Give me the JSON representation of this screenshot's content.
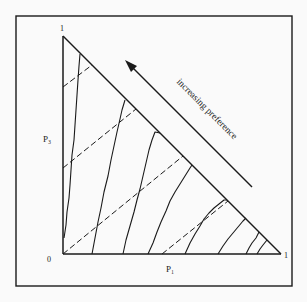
{
  "figure": {
    "type": "probability-triangle",
    "axes": {
      "x_label": "P₁",
      "y_label": "P₃",
      "origin_label": "0",
      "x_max_label": "1",
      "y_max_label": "1"
    },
    "annotation": {
      "arrow_label": "increasing preference"
    },
    "legend": {
      "solid_lines": "indifference curves",
      "dashed_lines": "iso-expected value lines"
    },
    "colors": {
      "ink": "#1a1a1a",
      "background": "#fafafa"
    },
    "counts": {
      "indifference_curves": 8,
      "dashed_lines": 4
    }
  }
}
